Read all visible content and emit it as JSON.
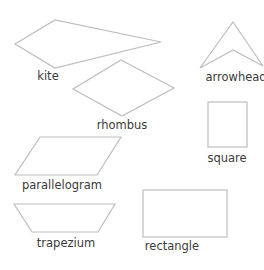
{
  "diagram": {
    "title": "",
    "shapes": [
      {
        "id": "kite",
        "label": "kite"
      },
      {
        "id": "arrowhead",
        "label": "arrowhead"
      },
      {
        "id": "rhombus",
        "label": "rhombus"
      },
      {
        "id": "square",
        "label": "square"
      },
      {
        "id": "parallelogram",
        "label": "parallelogram"
      },
      {
        "id": "trapezium",
        "label": "trapezium"
      },
      {
        "id": "rectangle",
        "label": "rectangle"
      }
    ],
    "colors": {
      "outline": "#bdbdbd",
      "text": "#3a3a3a",
      "background": "#ffffff"
    }
  }
}
